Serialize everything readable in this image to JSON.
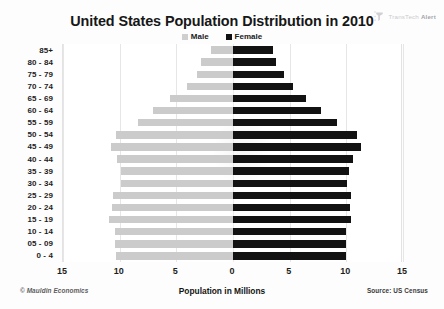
{
  "logo": {
    "name": "transtech-alert-logo",
    "text_light": "TransTech",
    "text_bold": "Alert"
  },
  "chart_data": {
    "type": "bar",
    "subtype": "population-pyramid",
    "title": "United States Population Distribution in 2010",
    "xlabel": "Population in Millions",
    "ylabel": "",
    "legend": [
      "Male",
      "Female"
    ],
    "legend_position": "top-center",
    "grid": true,
    "xlim": [
      -15,
      15
    ],
    "xticks": [
      "15",
      "10",
      "5",
      "0",
      "5",
      "10",
      "15"
    ],
    "xtick_values": [
      -15,
      -10,
      -5,
      0,
      5,
      10,
      15
    ],
    "categories": [
      "85+",
      "80 - 84",
      "75 - 79",
      "70 - 74",
      "65 - 69",
      "60 - 64",
      "55 - 59",
      "50 - 54",
      "45 - 49",
      "40 - 44",
      "35 - 39",
      "30 - 34",
      "25 - 29",
      "20 - 24",
      "15 - 19",
      "10 - 14",
      "05 - 09",
      "0 - 4"
    ],
    "series": [
      {
        "name": "Male",
        "color": "#cbcbcb",
        "values": [
          1.9,
          2.8,
          3.2,
          4.1,
          5.6,
          7.1,
          8.4,
          10.3,
          10.8,
          10.2,
          9.9,
          9.9,
          10.6,
          10.7,
          10.9,
          10.4,
          10.4,
          10.3
        ]
      },
      {
        "name": "Female",
        "color": "#121212",
        "values": [
          3.5,
          3.8,
          4.5,
          5.3,
          6.4,
          7.8,
          9.2,
          10.9,
          11.3,
          10.6,
          10.2,
          10.1,
          10.4,
          10.3,
          10.4,
          10.0,
          10.0,
          10.0
        ]
      }
    ],
    "credit": "© Mauldin Economics",
    "source": "Source: US Census"
  }
}
